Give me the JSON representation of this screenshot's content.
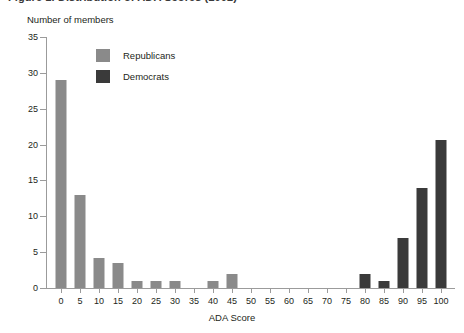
{
  "figure": {
    "title": "Figure 1. Distribution of ADA Scores (2002)",
    "x_axis_title": "ADA Score",
    "y_axis_title": "Number of members"
  },
  "legend": {
    "items": [
      {
        "label": "Republicans",
        "color": "#8a8a8a"
      },
      {
        "label": "Democrats",
        "color": "#3a3a3a"
      }
    ]
  },
  "chart_data": {
    "type": "bar",
    "title": "Figure 1. Distribution of ADA Scores (2002)",
    "xlabel": "ADA Score",
    "ylabel": "Number of members",
    "xlim": [
      0,
      100
    ],
    "ylim": [
      0,
      35
    ],
    "ytick_labels": [
      "0",
      "5",
      "10",
      "15",
      "20",
      "25",
      "30",
      "35"
    ],
    "yticks": [
      0,
      5,
      10,
      15,
      20,
      25,
      30,
      35
    ],
    "xticks": [
      0,
      5,
      10,
      15,
      20,
      25,
      30,
      35,
      40,
      45,
      50,
      55,
      60,
      65,
      70,
      75,
      80,
      85,
      90,
      95,
      100
    ],
    "xtick_labels": [
      "0",
      "5",
      "10",
      "15",
      "20",
      "25",
      "30",
      "35",
      "40",
      "45",
      "50",
      "55",
      "60",
      "65",
      "70",
      "75",
      "80",
      "85",
      "90",
      "95",
      "100"
    ],
    "grid": false,
    "legend_position": "upper-left-inside",
    "categories": [
      0,
      5,
      10,
      15,
      20,
      25,
      30,
      35,
      40,
      45,
      50,
      55,
      60,
      65,
      70,
      75,
      80,
      85,
      90,
      95,
      100
    ],
    "series": [
      {
        "name": "Republicans",
        "color": "#8a8a8a",
        "values": [
          29,
          13,
          4.2,
          3.5,
          1,
          1,
          1,
          0,
          1,
          2,
          0,
          0,
          0,
          0,
          0,
          0,
          0,
          0,
          0,
          0,
          0
        ]
      },
      {
        "name": "Democrats",
        "color": "#3a3a3a",
        "values": [
          0,
          0,
          0,
          0,
          0,
          0,
          0,
          0,
          0,
          0,
          0,
          0,
          0,
          0,
          0,
          0,
          2,
          1,
          7,
          14,
          20.7
        ]
      }
    ]
  }
}
